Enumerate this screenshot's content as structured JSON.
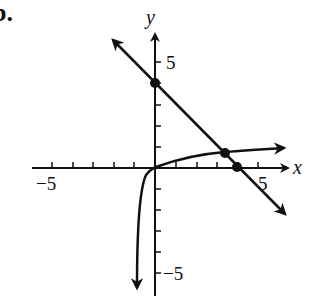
{
  "problem_label": "b.",
  "axes": {
    "x_label": "x",
    "y_label": "y",
    "x_tick_labels": [
      {
        "value": -5,
        "text": "−5"
      },
      {
        "value": 5,
        "text": "5"
      }
    ],
    "y_tick_labels": [
      {
        "value": 5,
        "text": "5"
      },
      {
        "value": -5,
        "text": "−5"
      }
    ],
    "x_range": [
      -6,
      6.5
    ],
    "y_range": [
      -6,
      6.5
    ],
    "ticks_every": 1
  },
  "curves": [
    {
      "name": "line",
      "equation": "y = -x + 4",
      "arrows": "both"
    },
    {
      "name": "log-curve",
      "description": "increasing curve through origin with vertical asymptote near x = -1",
      "arrows": "both"
    }
  ],
  "points": [
    {
      "name": "y-intercept",
      "x": 0,
      "y": 4
    },
    {
      "name": "intersection",
      "x": 3.4,
      "y": 0.7
    },
    {
      "name": "x-intercept",
      "x": 4,
      "y": 0
    }
  ],
  "colors": {
    "ink": "#111111",
    "background": "#ffffff"
  }
}
